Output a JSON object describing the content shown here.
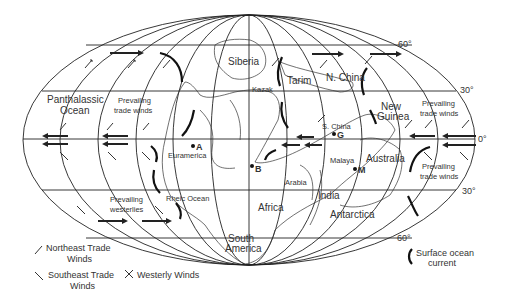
{
  "map": {
    "projection": "Mollweide",
    "latitude_labels": {
      "n60": "60°",
      "n30": "30°",
      "eq": "0°",
      "s30": "30°",
      "s60": "60°"
    },
    "regions": {
      "siberia": "Siberia",
      "kazak": "Kazak",
      "tarim": "Tarim",
      "n_china": "N. China",
      "s_china": "S. China",
      "new_guinea": "New Guinea",
      "new_guinea_l1": "New",
      "new_guinea_l2": "Guinea",
      "panthalassic_l1": "Panthalassic",
      "panthalassic_l2": "Ocean",
      "euramerica": "Euramerica",
      "rheic": "Rheic Ocean",
      "africa": "Africa",
      "south_america_l1": "South",
      "south_america_l2": "America",
      "arabia": "Arabia",
      "india": "India",
      "antarctica": "Antarctica",
      "malaya": "Malaya",
      "australia": "Australia"
    },
    "wind_labels": {
      "trade_nw_l1": "Prevailing",
      "trade_nw_l2": "trade winds",
      "trade_ne_l1": "Prevailing",
      "trade_ne_l2": "trade winds",
      "trade_se_l1": "Prevailing",
      "trade_se_l2": "trade winds",
      "westerlies_l1": "Prevailing",
      "westerlies_l2": "westerlies"
    },
    "points": {
      "A": "A",
      "B": "B",
      "G": "G",
      "M": "M"
    }
  },
  "legend": {
    "ne_trade_l1": "Northeast Trade",
    "ne_trade_l2": "Winds",
    "se_trade_l1": "Southeast Trade",
    "se_trade_l2": "Winds",
    "westerly": "Westerly Winds",
    "current_l1": "Surface ocean",
    "current_l2": "current"
  }
}
